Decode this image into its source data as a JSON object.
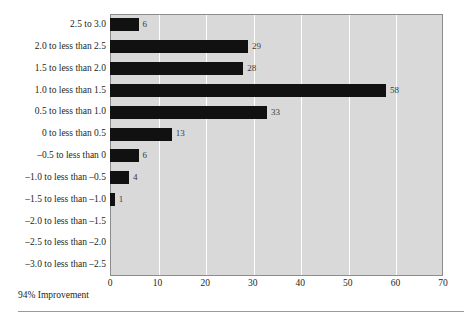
{
  "chart_data": {
    "type": "bar",
    "orientation": "horizontal",
    "title": "",
    "xlabel": "",
    "ylabel": "",
    "xlim": [
      0,
      70
    ],
    "grid": true,
    "legend": null,
    "categories": [
      "2.5 to 3.0",
      "2.0 to less than 2.5",
      "1.5 to less than 2.0",
      "1.0 to less than 1.5",
      "0.5 to less than 1.0",
      "0 to less than 0.5",
      "–0.5 to less than 0",
      "–1.0 to less than –0.5",
      "–1.5 to less than –1.0",
      "–2.0 to less than –1.5",
      "–2.5 to less than –2.0",
      "–3.0 to less than –2.5"
    ],
    "values": [
      6,
      29,
      28,
      58,
      33,
      13,
      6,
      4,
      1,
      0,
      0,
      0
    ],
    "value_labels": [
      "6",
      "29",
      "28",
      "58",
      "33",
      "13",
      "6",
      "4",
      "1",
      "",
      "",
      ""
    ],
    "xticks": [
      0,
      10,
      20,
      30,
      40,
      50,
      60,
      70
    ],
    "xtick_labels": [
      "0",
      "10",
      "20",
      "30",
      "40",
      "50",
      "60",
      "70"
    ],
    "bar_color": "#111111",
    "plot_background": "#d9d9d9",
    "gridline_color": "#ffffff"
  },
  "annotations": {
    "footnote": "94% Improvement",
    "bottom_caption": ""
  }
}
